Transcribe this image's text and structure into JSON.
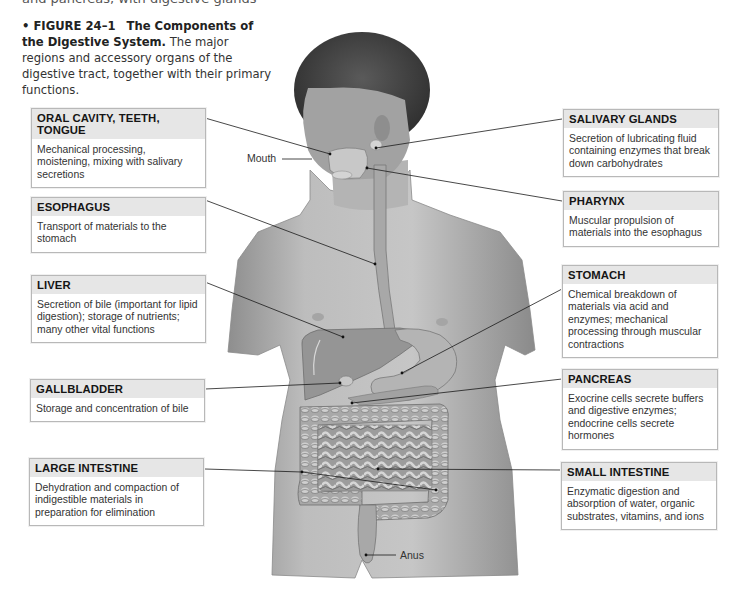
{
  "cutoff_text": "and pancreas, with digestive glands",
  "caption": {
    "figure_label": "• FIGURE 24–1",
    "title": "The Components of the Digestive System.",
    "text": "The major regions and accessory organs of the digestive tract, together with their primary functions."
  },
  "labels": {
    "mouth": "Mouth",
    "anus": "Anus"
  },
  "boxes": {
    "oral": {
      "title": "ORAL CAVITY, TEETH, TONGUE",
      "body": "Mechanical processing, moistening, mixing with salivary secretions"
    },
    "esophagus": {
      "title": "ESOPHAGUS",
      "body": "Transport of materials to the stomach"
    },
    "liver": {
      "title": "LIVER",
      "body": "Secretion of bile (important for lipid digestion); storage of nutrients; many other vital functions"
    },
    "gallbladder": {
      "title": "GALLBLADDER",
      "body": "Storage and concentration of bile"
    },
    "large_intestine": {
      "title": "LARGE INTESTINE",
      "body": "Dehydration and compaction of indigestible materials in preparation for elimination"
    },
    "salivary": {
      "title": "SALIVARY GLANDS",
      "body": "Secretion of lubricating fluid containing enzymes that break down carbohydrates"
    },
    "pharynx": {
      "title": "PHARYNX",
      "body": "Muscular propulsion of materials into the esophagus"
    },
    "stomach": {
      "title": "STOMACH",
      "body": "Chemical breakdown of materials via acid and enzymes; mechanical processing through muscular contractions"
    },
    "pancreas": {
      "title": "PANCREAS",
      "body": "Exocrine cells secrete buffers and digestive enzymes; endocrine cells secrete hormones"
    },
    "small_intestine": {
      "title": "SMALL INTESTINE",
      "body": "Enzymatic digestion and absorption of water, organic substrates, vitamins, and ions"
    }
  }
}
